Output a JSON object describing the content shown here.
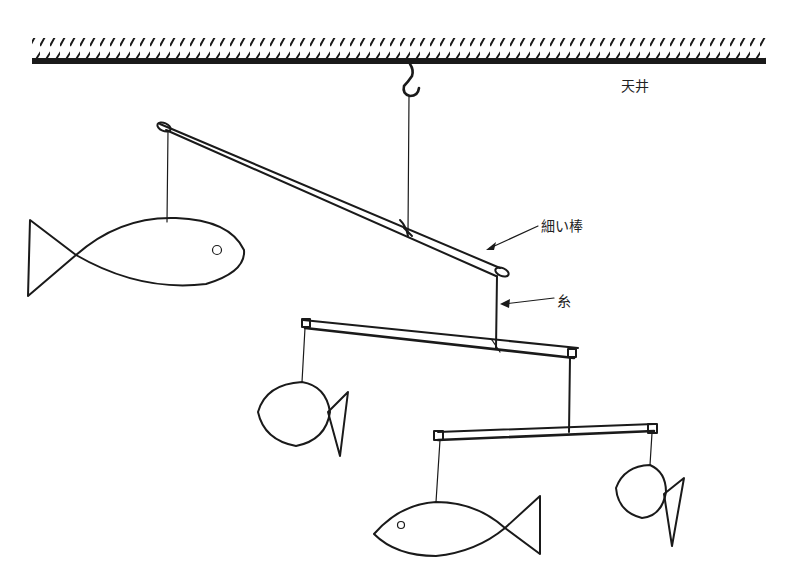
{
  "diagram": {
    "type": "hanging-mobile-illustration",
    "labels": {
      "ceiling": "天井",
      "thin_rod": "細い棒",
      "string": "糸"
    },
    "parts": [
      {
        "name": "ceiling",
        "pattern": "diagonal-hatch"
      },
      {
        "name": "hook"
      },
      {
        "name": "rod-top",
        "tilt": "down-right"
      },
      {
        "name": "rod-middle"
      },
      {
        "name": "rod-bottom"
      },
      {
        "name": "fish-large-left",
        "pattern": "horizontal-stripes"
      },
      {
        "name": "fish-round-middle",
        "pattern": "crosshatch"
      },
      {
        "name": "fish-long-bottom",
        "pattern": "vertical-stripes"
      },
      {
        "name": "fish-small-right",
        "pattern": "horizontal-stripes"
      }
    ],
    "colors": {
      "ink": "#1a1a1a",
      "background": "#ffffff"
    }
  }
}
